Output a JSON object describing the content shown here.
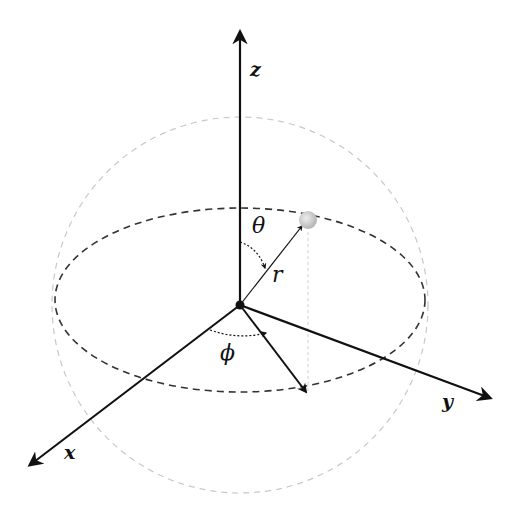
{
  "diagram": {
    "labels": {
      "z_axis": "z",
      "x_axis": "x",
      "y_axis": "y",
      "polar_angle": "θ",
      "azimuth_angle": "ϕ",
      "radius": "r"
    },
    "colors": {
      "axis": "#111111",
      "sphere_outline": "#c8c8c8",
      "equator": "#333333",
      "point": "#c8c8c8",
      "projection": "#dddddd"
    }
  }
}
